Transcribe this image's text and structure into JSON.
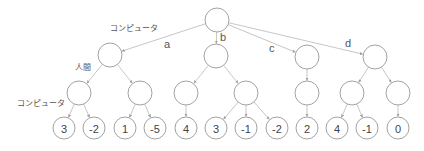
{
  "diagram": {
    "colors": {
      "stroke": "#8a8a8a",
      "edge": "#b8b8b8",
      "text": "#444444"
    },
    "level_labels": [
      {
        "text": "コンピュータ",
        "x": 110,
        "y": 25
      },
      {
        "text": "人間",
        "x": 75,
        "y": 64
      },
      {
        "text": "コンピュータ",
        "x": 17,
        "y": 100
      }
    ],
    "move_labels": [
      {
        "text": "a",
        "x": 164,
        "y": 39
      },
      {
        "text": "b",
        "x": 220,
        "y": 32
      },
      {
        "text": "c",
        "x": 269,
        "y": 43
      },
      {
        "text": "d",
        "x": 345,
        "y": 38
      }
    ],
    "nodes": [
      {
        "id": "root",
        "x": 217,
        "y": 20,
        "r": 12,
        "value": ""
      },
      {
        "id": "a",
        "x": 110,
        "y": 55,
        "r": 12,
        "value": "",
        "parent": "root"
      },
      {
        "id": "b",
        "x": 216,
        "y": 56,
        "r": 12,
        "value": "",
        "parent": "root"
      },
      {
        "id": "c",
        "x": 307,
        "y": 57,
        "r": 12,
        "value": "",
        "parent": "root"
      },
      {
        "id": "d",
        "x": 375,
        "y": 57,
        "r": 12,
        "value": "",
        "parent": "root"
      },
      {
        "id": "a1",
        "x": 79,
        "y": 93,
        "r": 12,
        "value": "",
        "parent": "a"
      },
      {
        "id": "a2",
        "x": 140,
        "y": 93,
        "r": 12,
        "value": "",
        "parent": "a"
      },
      {
        "id": "b1",
        "x": 186,
        "y": 93,
        "r": 12,
        "value": "",
        "parent": "b"
      },
      {
        "id": "b2",
        "x": 246,
        "y": 93,
        "r": 12,
        "value": "",
        "parent": "b"
      },
      {
        "id": "c1",
        "x": 307,
        "y": 93,
        "r": 12,
        "value": "",
        "parent": "c"
      },
      {
        "id": "d1",
        "x": 352,
        "y": 93,
        "r": 12,
        "value": "",
        "parent": "d"
      },
      {
        "id": "d2",
        "x": 398,
        "y": 93,
        "r": 12,
        "value": "",
        "parent": "d"
      },
      {
        "id": "l1",
        "x": 64,
        "y": 128,
        "r": 11,
        "value": "3",
        "parent": "a1"
      },
      {
        "id": "l2",
        "x": 94,
        "y": 128,
        "r": 11,
        "value": "-2",
        "parent": "a1"
      },
      {
        "id": "l3",
        "x": 125,
        "y": 128,
        "r": 11,
        "value": "1",
        "parent": "a2"
      },
      {
        "id": "l4",
        "x": 155,
        "y": 128,
        "r": 11,
        "value": "-5",
        "parent": "a2"
      },
      {
        "id": "l5",
        "x": 186,
        "y": 128,
        "r": 11,
        "value": "4",
        "parent": "b1"
      },
      {
        "id": "l6",
        "x": 216,
        "y": 128,
        "r": 11,
        "value": "3",
        "parent": "b2"
      },
      {
        "id": "l7",
        "x": 246,
        "y": 128,
        "r": 11,
        "value": "-1",
        "parent": "b2"
      },
      {
        "id": "l8",
        "x": 277,
        "y": 128,
        "r": 11,
        "value": "-2",
        "parent": "b2"
      },
      {
        "id": "l9",
        "x": 307,
        "y": 128,
        "r": 11,
        "value": "2",
        "parent": "c1"
      },
      {
        "id": "l10",
        "x": 337,
        "y": 128,
        "r": 11,
        "value": "4",
        "parent": "d1"
      },
      {
        "id": "l11",
        "x": 367,
        "y": 128,
        "r": 11,
        "value": "-1",
        "parent": "d1"
      },
      {
        "id": "l12",
        "x": 398,
        "y": 128,
        "r": 11,
        "value": "0",
        "parent": "d2"
      }
    ]
  }
}
